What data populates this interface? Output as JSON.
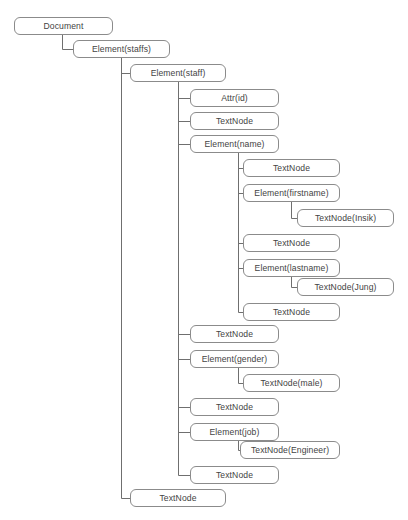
{
  "diagram": {
    "type": "dom-tree",
    "title_visible": false,
    "style": {
      "box_border_color": "#8b8b8b",
      "box_fill_color": "#ffffff",
      "text_color": "#434343",
      "link_color": "#6f6f6f",
      "background": "#ffffff"
    },
    "nodes": [
      {
        "id": "n0",
        "label": "Document",
        "x": 14,
        "y": 17,
        "w": 99,
        "h": 18,
        "depth": 0,
        "parent": null
      },
      {
        "id": "n1",
        "label": "Element(staffs)",
        "x": 73,
        "y": 40,
        "w": 97,
        "h": 18,
        "depth": 1,
        "parent": "n0"
      },
      {
        "id": "n2",
        "label": "Element(staff)",
        "x": 130,
        "y": 64,
        "w": 96,
        "h": 18,
        "depth": 2,
        "parent": "n1"
      },
      {
        "id": "n3",
        "label": "Attr(id)",
        "x": 190,
        "y": 89,
        "w": 89,
        "h": 18,
        "depth": 3,
        "parent": "n2"
      },
      {
        "id": "n4",
        "label": "TextNode",
        "x": 190,
        "y": 112,
        "w": 89,
        "h": 18,
        "depth": 3,
        "parent": "n2"
      },
      {
        "id": "n5",
        "label": "Element(name)",
        "x": 190,
        "y": 135,
        "w": 89,
        "h": 18,
        "depth": 3,
        "parent": "n2"
      },
      {
        "id": "n6",
        "label": "TextNode",
        "x": 243,
        "y": 159,
        "w": 97,
        "h": 18,
        "depth": 4,
        "parent": "n5"
      },
      {
        "id": "n7",
        "label": "Element(firstname)",
        "x": 243,
        "y": 184,
        "w": 97,
        "h": 18,
        "depth": 4,
        "parent": "n5"
      },
      {
        "id": "n8",
        "label": "TextNode(Insik)",
        "x": 297,
        "y": 209,
        "w": 97,
        "h": 18,
        "depth": 5,
        "parent": "n7"
      },
      {
        "id": "n9",
        "label": "TextNode",
        "x": 243,
        "y": 234,
        "w": 97,
        "h": 18,
        "depth": 4,
        "parent": "n5"
      },
      {
        "id": "n10",
        "label": "Element(lastname)",
        "x": 243,
        "y": 259,
        "w": 97,
        "h": 18,
        "depth": 4,
        "parent": "n5"
      },
      {
        "id": "n11",
        "label": "TextNode(Jung)",
        "x": 297,
        "y": 278,
        "w": 97,
        "h": 18,
        "depth": 5,
        "parent": "n10"
      },
      {
        "id": "n12",
        "label": "TextNode",
        "x": 243,
        "y": 303,
        "w": 97,
        "h": 18,
        "depth": 4,
        "parent": "n5"
      },
      {
        "id": "n13",
        "label": "TextNode",
        "x": 190,
        "y": 325,
        "w": 89,
        "h": 18,
        "depth": 3,
        "parent": "n2"
      },
      {
        "id": "n14",
        "label": "Element(gender)",
        "x": 190,
        "y": 350,
        "w": 89,
        "h": 18,
        "depth": 3,
        "parent": "n2"
      },
      {
        "id": "n15",
        "label": "TextNode(male)",
        "x": 243,
        "y": 374,
        "w": 97,
        "h": 18,
        "depth": 4,
        "parent": "n14"
      },
      {
        "id": "n16",
        "label": "TextNode",
        "x": 190,
        "y": 398,
        "w": 89,
        "h": 18,
        "depth": 3,
        "parent": "n2"
      },
      {
        "id": "n17",
        "label": "Element(job)",
        "x": 190,
        "y": 423,
        "w": 89,
        "h": 18,
        "depth": 3,
        "parent": "n2"
      },
      {
        "id": "n18",
        "label": "TextNode(Engineer)",
        "x": 240,
        "y": 441,
        "w": 100,
        "h": 18,
        "depth": 4,
        "parent": "n17"
      },
      {
        "id": "n19",
        "label": "TextNode",
        "x": 190,
        "y": 466,
        "w": 89,
        "h": 18,
        "depth": 3,
        "parent": "n2"
      },
      {
        "id": "n20",
        "label": "TextNode",
        "x": 130,
        "y": 489,
        "w": 96,
        "h": 18,
        "depth": 2,
        "parent": "n1"
      }
    ]
  }
}
